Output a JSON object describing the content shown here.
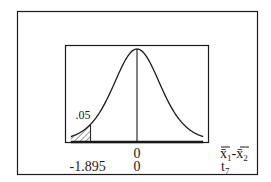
{
  "chart_data": {
    "type": "area",
    "title": "",
    "distribution": "t",
    "degrees_of_freedom": 7,
    "mean": 0,
    "x_range_t": [
      -2.7,
      2.7
    ],
    "shaded_region": {
      "side": "left",
      "from_t": -2.7,
      "to_t": -1.895,
      "area_label": ".05",
      "style": "hatched"
    },
    "center_line_t": 0,
    "axis_scales": [
      {
        "name": "x̄₁-x̄₂",
        "base": "x̄",
        "sub1": "1",
        "sep": "-",
        "sub2": "2",
        "ticks": [
          {
            "at_t": 0,
            "label": "0"
          }
        ]
      },
      {
        "name": "t₇",
        "base": "t",
        "sub": "7",
        "ticks": [
          {
            "at_t": -1.895,
            "label": "-1.895"
          },
          {
            "at_t": 0,
            "label": "0"
          }
        ]
      }
    ],
    "grid": false,
    "legend": "none"
  },
  "colors": {
    "ink": "#1a1a1a",
    "background": "#ffffff"
  }
}
